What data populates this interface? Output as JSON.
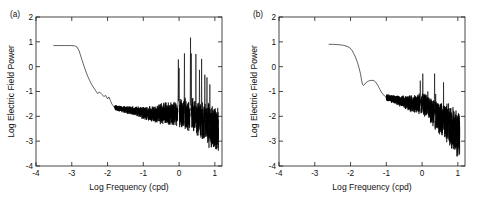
{
  "figure": {
    "background": "#ffffff",
    "line_color": "#000000",
    "axis_color": "#1a1a1a"
  },
  "chart_data": [
    {
      "type": "line",
      "panel_label": "(a)",
      "title": "",
      "xlabel": "Log Frequency (cpd)",
      "ylabel": "Log Electric Field Power",
      "xlim": [
        -4,
        1.2
      ],
      "ylim": [
        -4,
        2
      ],
      "xticks": [
        -4,
        -3,
        -2,
        -1,
        0,
        1
      ],
      "xticklabels": [
        "-4",
        "-3",
        "-2",
        "-1",
        "0",
        "1"
      ],
      "yticks": [
        -4,
        -3,
        -2,
        -1,
        0,
        1,
        2
      ],
      "yticklabels": [
        "-4",
        "-3",
        "-2",
        "-1",
        "0",
        "1",
        "2"
      ],
      "grid": false,
      "legend": false,
      "description": "Log electric field power spectrum: flat plateau near 0.85 from log-f -3.5 to -2.8, steep rolloff to about -1.8 by log-f -2, broadband noise floor slowly declining with increasing scatter, strong harmonic spike cluster near log-f 0 to 0.7 with tallest spike reaching 1.4, data terminating near log-f 1.1 around -3.4.",
      "x": [
        -3.5,
        -3.4,
        -3.3,
        -3.2,
        -3.1,
        -3.0,
        -2.92,
        -2.86,
        -2.8,
        -2.76,
        -2.72,
        -2.68,
        -2.64,
        -2.6,
        -2.55,
        -2.5,
        -2.45,
        -2.4,
        -2.34,
        -2.28,
        -2.22,
        -2.16,
        -2.1,
        -2.05,
        -2.0,
        -1.96,
        -1.92,
        -1.88,
        -1.84,
        -1.8
      ],
      "y": [
        0.85,
        0.85,
        0.85,
        0.85,
        0.85,
        0.85,
        0.84,
        0.8,
        0.66,
        0.48,
        0.3,
        0.12,
        -0.05,
        -0.22,
        -0.4,
        -0.56,
        -0.7,
        -0.82,
        -0.95,
        -1.08,
        -1.02,
        -1.12,
        -1.2,
        -1.16,
        -1.3,
        -1.22,
        -1.36,
        -1.5,
        -1.58,
        -1.65
      ],
      "noise_floor_level": -1.9,
      "peak_spike_value": 1.4,
      "peak_spike_x": 0.32,
      "data_end_x": 1.1
    },
    {
      "type": "line",
      "panel_label": "(b)",
      "title": "",
      "xlabel": "Log Frequency (cpd)",
      "ylabel": "Log Electric Field Power",
      "xlim": [
        -4,
        1.2
      ],
      "ylim": [
        -4,
        2
      ],
      "xticks": [
        -4,
        -3,
        -2,
        -1,
        0,
        1
      ],
      "xticklabels": [
        "-4",
        "-3",
        "-2",
        "-1",
        "0",
        "1"
      ],
      "yticks": [
        -4,
        -3,
        -2,
        -1,
        0,
        1,
        2
      ],
      "yticklabels": [
        "-4",
        "-3",
        "-2",
        "-1",
        "0",
        "1",
        "2"
      ],
      "grid": false,
      "legend": false,
      "description": "Log electric field power spectrum starting at log-f -2.6 near 0.9, gentle decline then steep drop to -0.75 at log-f -1.65, a local bump back to -0.55 near -1.35, continued decline to a noise floor near -1.5, broadening scatter after log-f -1, sparse narrow spikes near log-f 0 and 0.35 reaching about -0.2, data terminating near log-f 1.05 around -3.5.",
      "x": [
        -2.6,
        -2.5,
        -2.4,
        -2.3,
        -2.2,
        -2.1,
        -2.02,
        -1.96,
        -1.9,
        -1.85,
        -1.8,
        -1.76,
        -1.72,
        -1.7,
        -1.68,
        -1.66,
        -1.64,
        -1.6,
        -1.55,
        -1.5,
        -1.45,
        -1.4,
        -1.35,
        -1.3,
        -1.26,
        -1.22,
        -1.18,
        -1.14,
        -1.1,
        -1.05,
        -1.0
      ],
      "y": [
        0.9,
        0.9,
        0.89,
        0.88,
        0.86,
        0.82,
        0.76,
        0.66,
        0.5,
        0.34,
        0.14,
        -0.06,
        -0.3,
        -0.48,
        -0.62,
        -0.72,
        -0.76,
        -0.7,
        -0.62,
        -0.58,
        -0.56,
        -0.55,
        -0.56,
        -0.62,
        -0.7,
        -0.8,
        -0.92,
        -1.02,
        -1.1,
        -1.18,
        -1.24
      ],
      "noise_floor_level": -1.5,
      "peak_spike_value": -0.2,
      "peak_spike_x": 0.35,
      "data_end_x": 1.05
    }
  ]
}
